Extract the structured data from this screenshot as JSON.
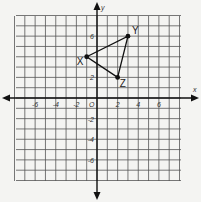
{
  "chart_data": {
    "type": "scatter",
    "title": "",
    "xlabel": "x",
    "ylabel": "y",
    "origin_label": "O",
    "xlim": [
      -8,
      8
    ],
    "ylim": [
      -8,
      8
    ],
    "grid": true,
    "x_ticks": [
      -6,
      -4,
      -2,
      2,
      4,
      6
    ],
    "y_ticks": [
      6,
      2,
      -2,
      -4,
      -6
    ],
    "x_tick_labels": [
      "-6",
      "-4",
      "-2",
      "2",
      "4",
      "6"
    ],
    "y_tick_labels": [
      "6",
      "2",
      "-2",
      "-4",
      "-6"
    ],
    "points": [
      {
        "label": "X",
        "x": -1,
        "y": 4
      },
      {
        "label": "Y",
        "x": 3,
        "y": 6
      },
      {
        "label": "Z",
        "x": 2,
        "y": 2
      }
    ],
    "polygon": [
      "X",
      "Y",
      "Z"
    ]
  }
}
